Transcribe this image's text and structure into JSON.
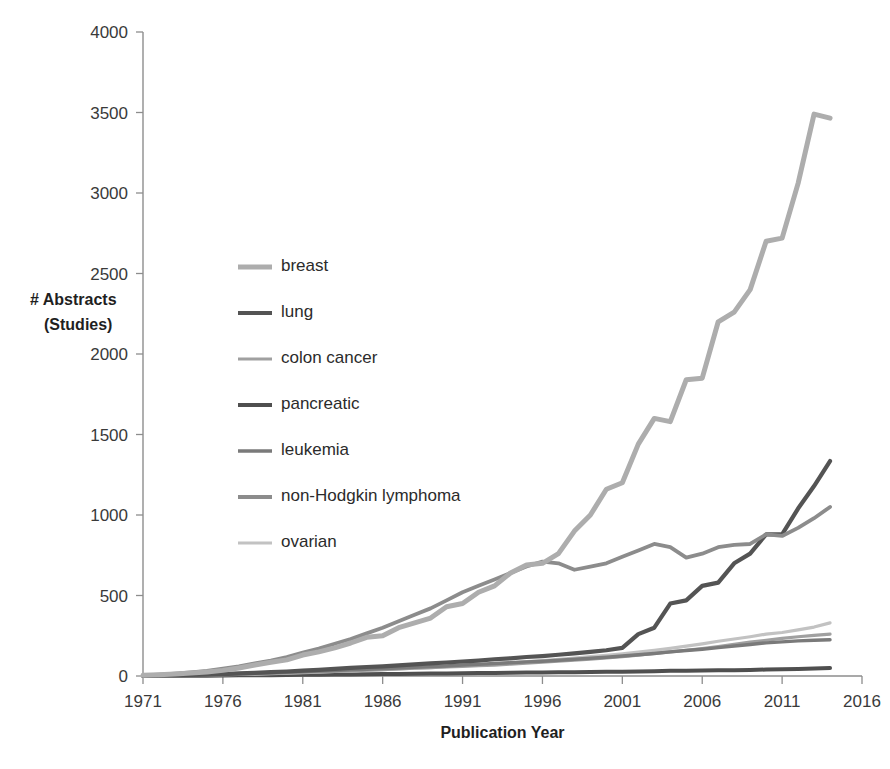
{
  "chart_data": {
    "type": "line",
    "title": "",
    "xlabel": "Publication Year",
    "ylabel": "# Abstracts\n(Studies)",
    "ylabel_line1": "# Abstracts",
    "ylabel_line2": "(Studies)",
    "xlim": [
      1971,
      2016
    ],
    "ylim": [
      0,
      4000
    ],
    "xticks": [
      1971,
      1976,
      1981,
      1986,
      1991,
      1996,
      2001,
      2006,
      2011,
      2016
    ],
    "yticks": [
      0,
      500,
      1000,
      1500,
      2000,
      2500,
      3000,
      3500,
      4000
    ],
    "grid": false,
    "legend_position": "inside-left",
    "x": [
      1971,
      1972,
      1973,
      1974,
      1975,
      1976,
      1977,
      1978,
      1979,
      1980,
      1981,
      1982,
      1983,
      1984,
      1985,
      1986,
      1987,
      1988,
      1989,
      1990,
      1991,
      1992,
      1993,
      1994,
      1995,
      1996,
      1997,
      1998,
      1999,
      2000,
      2001,
      2002,
      2003,
      2004,
      2005,
      2006,
      2007,
      2008,
      2009,
      2010,
      2011,
      2012,
      2013,
      2014
    ],
    "series": [
      {
        "name": "breast",
        "color": "#ADADAD",
        "width": 5.0,
        "values": [
          5,
          8,
          12,
          18,
          25,
          35,
          50,
          68,
          85,
          100,
          130,
          150,
          175,
          205,
          240,
          250,
          300,
          330,
          360,
          430,
          450,
          520,
          560,
          640,
          690,
          700,
          760,
          900,
          1000,
          1160,
          1200,
          1440,
          1600,
          1580,
          1840,
          1850,
          2200,
          2260,
          2400,
          2700,
          2720,
          3060,
          3490,
          3465
        ]
      },
      {
        "name": "lung",
        "color": "#545454",
        "width": 4.2,
        "values": [
          2,
          3,
          5,
          7,
          9,
          12,
          16,
          20,
          24,
          28,
          34,
          38,
          44,
          50,
          56,
          60,
          66,
          72,
          78,
          84,
          90,
          96,
          104,
          110,
          118,
          124,
          132,
          140,
          150,
          160,
          175,
          260,
          300,
          450,
          470,
          560,
          580,
          700,
          760,
          880,
          880,
          1040,
          1180,
          1335
        ]
      },
      {
        "name": "colon cancer",
        "color": "#A0A0A0",
        "width": 3.2,
        "values": [
          1,
          2,
          3,
          4,
          6,
          8,
          10,
          13,
          16,
          19,
          22,
          25,
          28,
          32,
          36,
          40,
          44,
          48,
          52,
          56,
          60,
          64,
          68,
          74,
          80,
          86,
          92,
          98,
          104,
          112,
          120,
          130,
          140,
          150,
          160,
          170,
          182,
          196,
          210,
          222,
          234,
          244,
          252,
          260
        ]
      },
      {
        "name": "pancreatic",
        "color": "#4F4F4F",
        "width": 4.0,
        "values": [
          0,
          1,
          1,
          2,
          2,
          3,
          4,
          4,
          5,
          6,
          7,
          8,
          9,
          10,
          11,
          12,
          13,
          14,
          15,
          16,
          17,
          18,
          19,
          20,
          21,
          22,
          23,
          24,
          25,
          26,
          27,
          28,
          30,
          32,
          33,
          34,
          35,
          36,
          38,
          40,
          42,
          44,
          47,
          50
        ]
      },
      {
        "name": "leukemia",
        "color": "#7A7A7A",
        "width": 3.4,
        "values": [
          2,
          3,
          5,
          7,
          9,
          11,
          14,
          17,
          20,
          23,
          27,
          30,
          34,
          38,
          42,
          46,
          50,
          54,
          58,
          62,
          68,
          72,
          78,
          82,
          88,
          92,
          98,
          104,
          110,
          116,
          124,
          132,
          140,
          150,
          158,
          166,
          176,
          186,
          196,
          206,
          212,
          218,
          222,
          225
        ]
      },
      {
        "name": "non-Hodgkin lymphoma",
        "color": "#8C8C8C",
        "width": 3.8,
        "values": [
          4,
          8,
          14,
          22,
          32,
          45,
          60,
          78,
          96,
          118,
          145,
          170,
          200,
          230,
          265,
          300,
          340,
          380,
          420,
          470,
          520,
          560,
          600,
          640,
          680,
          710,
          700,
          660,
          680,
          700,
          740,
          780,
          820,
          800,
          735,
          760,
          800,
          815,
          820,
          880,
          870,
          920,
          980,
          1050
        ]
      },
      {
        "name": "ovarian",
        "color": "#C2C2C2",
        "width": 3.2,
        "values": [
          1,
          2,
          3,
          4,
          6,
          8,
          10,
          12,
          15,
          18,
          21,
          24,
          28,
          32,
          36,
          40,
          44,
          48,
          52,
          58,
          64,
          70,
          76,
          82,
          90,
          96,
          104,
          112,
          120,
          128,
          138,
          148,
          160,
          172,
          186,
          200,
          216,
          230,
          244,
          260,
          270,
          286,
          304,
          330
        ]
      }
    ],
    "legend": [
      {
        "label": "breast",
        "color": "#ADADAD",
        "width": 5.0
      },
      {
        "label": "lung",
        "color": "#545454",
        "width": 4.2
      },
      {
        "label": "colon cancer",
        "color": "#A0A0A0",
        "width": 3.2
      },
      {
        "label": "pancreatic",
        "color": "#4F4F4F",
        "width": 4.0
      },
      {
        "label": "leukemia",
        "color": "#7A7A7A",
        "width": 3.4
      },
      {
        "label": "non-Hodgkin lymphoma",
        "color": "#8C8C8C",
        "width": 3.8
      },
      {
        "label": "ovarian",
        "color": "#C2C2C2",
        "width": 3.2
      }
    ]
  },
  "layout": {
    "plot_left": 143,
    "plot_right": 862,
    "plot_top": 32,
    "plot_bottom": 676,
    "legend_x": 238,
    "legend_swatch_len": 34,
    "legend_text_gap": 9,
    "legend_start_y": 267,
    "legend_step_y": 46,
    "axis_color": "#8d8d8d"
  }
}
